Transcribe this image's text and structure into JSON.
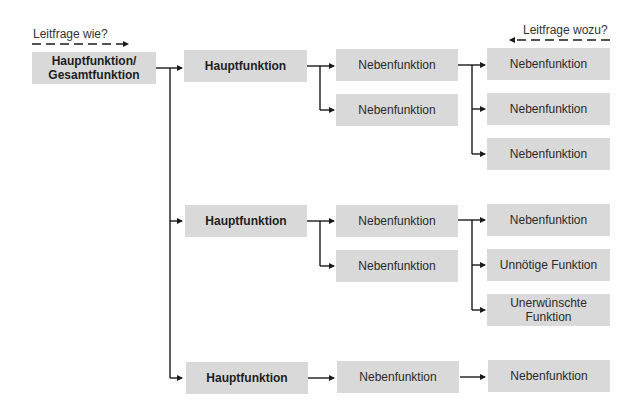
{
  "guides": {
    "left": {
      "text": "Leitfrage wie?",
      "direction": "right"
    },
    "right": {
      "text": "Leitfrage wozu?",
      "direction": "left"
    }
  },
  "root": {
    "label": "Hauptfunktion/\nGesamtfunktion",
    "line1": "Hauptfunktion/",
    "line2": "Gesamtfunktion"
  },
  "branches": [
    {
      "hauptfunktion": "Hauptfunktion",
      "nebenfunktionen": [
        "Nebenfunktion",
        "Nebenfunktion"
      ],
      "level3": [
        "Nebenfunktion",
        "Nebenfunktion",
        "Nebenfunktion"
      ]
    },
    {
      "hauptfunktion": "Hauptfunktion",
      "nebenfunktionen": [
        "Nebenfunktion",
        "Nebenfunktion"
      ],
      "level3": [
        "Nebenfunktion",
        "Unnötige Funktion",
        "Unerwünschte Funktion"
      ],
      "level3_last_line1": "Unerwünschte",
      "level3_last_line2": "Funktion"
    },
    {
      "hauptfunktion": "Hauptfunktion",
      "nebenfunktionen": [
        "Nebenfunktion"
      ],
      "level3": [
        "Nebenfunktion"
      ]
    }
  ],
  "colors": {
    "box_fill": "#d9d9d9",
    "line": "#1a1a1a",
    "background": "#ffffff"
  }
}
